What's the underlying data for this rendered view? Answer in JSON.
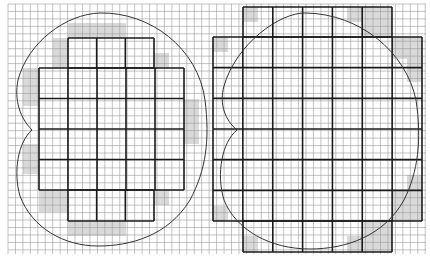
{
  "canvas": {
    "width": 430,
    "height": 259,
    "background": "#ffffff"
  },
  "grid": {
    "x0": 8,
    "y0": 4,
    "x1": 426,
    "y1": 254,
    "cell": 7.45,
    "thin_color": "#9a9a9a",
    "thick_color": "#1a1a1a",
    "shade_color": "#d9d9d9"
  },
  "figures": [
    {
      "name": "left-figure",
      "blocks": [
        {
          "x": 68,
          "y": 38,
          "w": 86,
          "h": 30,
          "cols": 3,
          "rows": 1
        },
        {
          "x": 39,
          "y": 68,
          "w": 145,
          "h": 122,
          "cols": 5,
          "rows": 4
        },
        {
          "x": 68,
          "y": 190,
          "w": 86,
          "h": 31,
          "cols": 3,
          "rows": 1
        }
      ],
      "shaded": [
        {
          "x": 68,
          "y": 23,
          "w": 58,
          "h": 15
        },
        {
          "x": 53,
          "y": 38,
          "w": 15,
          "h": 30
        },
        {
          "x": 39,
          "y": 60,
          "w": 0,
          "h": 0
        },
        {
          "x": 23,
          "y": 68,
          "w": 16,
          "h": 38
        },
        {
          "x": 154,
          "y": 53,
          "w": 15,
          "h": 15
        },
        {
          "x": 184,
          "y": 99,
          "w": 15,
          "h": 45
        },
        {
          "x": 23,
          "y": 144,
          "w": 16,
          "h": 30
        },
        {
          "x": 39,
          "y": 190,
          "w": 29,
          "h": 22
        },
        {
          "x": 154,
          "y": 190,
          "w": 15,
          "h": 15
        },
        {
          "x": 68,
          "y": 221,
          "w": 58,
          "h": 15
        }
      ],
      "outline_path": "M32,130 C20,118 14,100 18,80 C28,42 66,14 100,13 C150,12 198,48 205,100 C210,140 206,170 190,200 C168,236 130,246 98,246 C64,246 32,228 20,196 C13,172 18,142 32,130 Z"
    },
    {
      "name": "right-figure",
      "blocks": [
        {
          "x": 243,
          "y": 7,
          "w": 149,
          "h": 30,
          "cols": 5,
          "rows": 1
        },
        {
          "x": 213,
          "y": 37,
          "w": 209,
          "h": 184,
          "cols": 7,
          "rows": 6
        },
        {
          "x": 243,
          "y": 221,
          "w": 149,
          "h": 31,
          "cols": 5,
          "rows": 1
        }
      ],
      "shaded": [
        {
          "x": 243,
          "y": 7,
          "w": 15,
          "h": 15
        },
        {
          "x": 347,
          "y": 7,
          "w": 16,
          "h": 15
        },
        {
          "x": 363,
          "y": 7,
          "w": 29,
          "h": 30
        },
        {
          "x": 213,
          "y": 37,
          "w": 15,
          "h": 15
        },
        {
          "x": 392,
          "y": 37,
          "w": 30,
          "h": 22
        },
        {
          "x": 407,
          "y": 59,
          "w": 15,
          "h": 23
        },
        {
          "x": 407,
          "y": 175,
          "w": 15,
          "h": 16
        },
        {
          "x": 392,
          "y": 191,
          "w": 30,
          "h": 30
        },
        {
          "x": 213,
          "y": 206,
          "w": 15,
          "h": 15
        },
        {
          "x": 363,
          "y": 221,
          "w": 29,
          "h": 31
        },
        {
          "x": 347,
          "y": 236,
          "w": 16,
          "h": 16
        },
        {
          "x": 243,
          "y": 236,
          "w": 15,
          "h": 16
        }
      ],
      "outline_path": "M237,130 C225,120 219,104 224,86 C236,44 280,12 306,13 C360,14 406,52 416,100 C422,140 418,172 404,200 C384,236 346,249 310,249 C270,249 236,230 224,200 C216,174 222,142 237,130 Z"
    }
  ]
}
